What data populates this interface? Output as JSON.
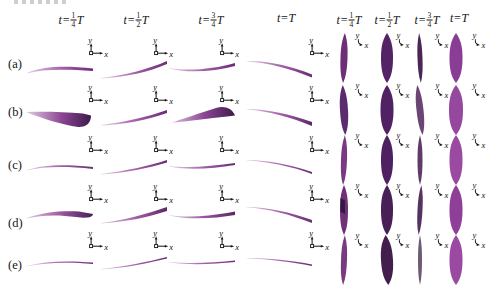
{
  "figure": {
    "background": "#ffffff",
    "description_rows": 5
  },
  "rows": [
    "(a)",
    "(b)",
    "(c)",
    "(d)",
    "(e)"
  ],
  "axis_labels": {
    "x": "x",
    "y": "y"
  },
  "headers_side": [
    {
      "lhs": "t=",
      "num": "1",
      "den": "4",
      "rhs": "T"
    },
    {
      "lhs": "t=",
      "num": "1",
      "den": "2",
      "rhs": "T"
    },
    {
      "lhs": "t=",
      "num": "3",
      "den": "4",
      "rhs": "T"
    },
    {
      "lhs": "t=",
      "rhs": "T"
    }
  ],
  "headers_front": [
    {
      "lhs": "t=",
      "num": "1",
      "den": "4",
      "rhs": "T"
    },
    {
      "lhs": "t=",
      "num": "1",
      "den": "2",
      "rhs": "T"
    },
    {
      "lhs": "t=",
      "num": "3",
      "den": "4",
      "rhs": "T"
    },
    {
      "lhs": "t=",
      "rhs": "T"
    }
  ],
  "colors": {
    "plate_light": "#e6d2e6",
    "plate_mid": "#a05ba5",
    "plate_dark": "#6b2d76",
    "wedge_dark": "#3f1a4d",
    "leaf_dark": "#4a2058",
    "leaf_bright": "#9a4aa1",
    "axis_ink": "#111111"
  },
  "layout": {
    "canvas": {
      "w": 503,
      "h": 301
    },
    "row_label_x": 8,
    "row_label_y": [
      57,
      105,
      158,
      216,
      258
    ],
    "header_y": 12,
    "side_header_cx": [
      71,
      136,
      211,
      286
    ],
    "front_header_cx": [
      349,
      387,
      427,
      459
    ],
    "side_col_x": [
      27,
      101,
      169,
      246
    ],
    "side_row_y": [
      56,
      104,
      154,
      202,
      250
    ],
    "side_icon_x": [
      85,
      150,
      216,
      306
    ],
    "side_icon_y": [
      36,
      83,
      133,
      182,
      229
    ],
    "front_col_cx": [
      344,
      387,
      420,
      456
    ],
    "front_row_y": [
      32,
      84,
      134,
      184,
      234
    ],
    "front_icon_x": [
      352,
      393,
      432,
      469
    ],
    "front_icon_y": [
      31,
      81,
      131,
      181,
      231
    ],
    "leaf_h": 52
  },
  "side_cells": [
    [
      {
        "path": "M0,17 C18,9.5 40,10 66,12.5 L66,15 C40,13.5 18,12.5 0,17.5 Z",
        "g": [
          "#e6d2e6",
          "#a05ba5",
          "#6b2d76"
        ]
      },
      {
        "path": "M0,22 C25,19 48,13 66,5 L66,8 C48,16 25,21 0,22.5 Z",
        "g": [
          "#e6d2e6",
          "#a05ba5",
          "#6b2d76"
        ]
      },
      {
        "path": "M0,12 C20,15.5 45,13 66,7 L66,10 C45,15.5 20,17.5 0,12.5 Z",
        "g": [
          "#e6d2e6",
          "#a05ba5",
          "#6b2d76"
        ]
      },
      {
        "path": "M1,5 C22,4.5 45,10 66,18.5 L66,21.5 C45,13 22,6.5 1,5.5 Z",
        "g": [
          "#e6d2e6",
          "#a05ba5",
          "#6b2d76"
        ]
      }
    ],
    [
      {
        "path": "M0,8 C18,7.5 38,8 56,9.5 L64,11.5 C64,19 59,23.5 51,23 C35,21 13,13.5 0,8.5 Z",
        "g": [
          "#e0c9e0",
          "#8a4492",
          "#3f1a4d"
        ]
      },
      {
        "path": "M0,21 C24,18 46,13 66,6 L66,9 C46,16 24,20.5 0,21.5 Z",
        "g": [
          "#e6d2e6",
          "#a05ba5",
          "#6b2d76"
        ]
      },
      {
        "path": "M0,19 C20,17 40,14.5 58,12.5 L66,11.5 C63,4 55,1.5 47,4 C31,9 12,15.5 0,19.5 Z",
        "g": [
          "#e0c9e0",
          "#8a4492",
          "#3f1a4d"
        ]
      },
      {
        "path": "M1,5 C22,5 44,10.5 66,18 L66,22 C44,13 22,7 1,5.5 Z",
        "g": [
          "#e6d2e6",
          "#a05ba5",
          "#5e2769"
        ]
      }
    ],
    [
      {
        "path": "M0,16 C16,10.5 38,10 66,13 L66,15 C38,12 16,12.5 0,16.5 Z",
        "g": [
          "#e6d2e6",
          "#a05ba5",
          "#6b2d76"
        ]
      },
      {
        "path": "M0,20 C24,17 48,12 66,6 L66,8.5 C48,14 24,19 0,20.5 Z",
        "g": [
          "#e6d2e6",
          "#a05ba5",
          "#6b2d76"
        ]
      },
      {
        "path": "M0,12 C20,14.5 44,12 66,9 L66,11 C44,14.5 20,16.5 0,12.5 Z",
        "g": [
          "#e6d2e6",
          "#a05ba5",
          "#6b2d76"
        ]
      },
      {
        "path": "M1,6 C22,6 46,11 66,18 L66,20 C46,12.5 22,7.5 1,6.5 Z",
        "g": [
          "#e6d2e6",
          "#a05ba5",
          "#6b2d76"
        ]
      }
    ],
    [
      {
        "path": "M0,16 C16,10 36,8.5 52,9.5 L66,12 C66,15.5 59,16.5 49,15 C31,12.5 14,13 0,16.5 Z",
        "g": [
          "#e0c9e0",
          "#96529b",
          "#44205a"
        ]
      },
      {
        "path": "M0,21 C24,18 46,12 66,5 L66,9 C46,15.5 24,20 0,21.5 Z",
        "g": [
          "#e6d2e6",
          "#a05ba5",
          "#5e2769"
        ]
      },
      {
        "path": "M0,13 C18,16 40,14 58,11 L66,9.5 L66,13 C46,16.5 20,18 0,13.5 Z",
        "g": [
          "#e6d2e6",
          "#96529b",
          "#5e2769"
        ]
      },
      {
        "path": "M1,5 C22,5 44,10.5 66,18 L66,21 C44,12.5 22,6.5 1,5.5 Z",
        "g": [
          "#e6d2e6",
          "#a05ba5",
          "#6b2d76"
        ]
      }
    ],
    [
      {
        "path": "M0,16 C18,11 40,10.5 66,12.5 L66,14 C40,12 18,12.5 0,16.5 Z",
        "g": [
          "#e6d2e6",
          "#a05ba5",
          "#6b2d76"
        ]
      },
      {
        "path": "M0,19 C24,16.5 46,12 66,7 L66,8.5 C46,13.5 24,18 0,19.5 Z",
        "g": [
          "#e6d2e6",
          "#a05ba5",
          "#6b2d76"
        ]
      },
      {
        "path": "M0,12 C22,14 46,12.5 66,10.5 L66,12 C46,14 22,15.5 0,12.5 Z",
        "g": [
          "#e6d2e6",
          "#a05ba5",
          "#6b2d76"
        ]
      },
      {
        "path": "M1,8 C22,8 46,10.5 66,14.5 L66,16 C46,12 22,9 1,8.5 Z",
        "g": [
          "#e6d2e6",
          "#a05ba5",
          "#6b2d76"
        ]
      }
    ]
  ],
  "front_cells": [
    [
      {
        "rx": 3.5,
        "fill": "#6d2f76",
        "skew": -2
      },
      {
        "rx": 6.0,
        "fill": "#532366",
        "skew": 0
      },
      {
        "rx": 2.5,
        "fill": "#4a2555",
        "skew": 2
      },
      {
        "rx": 6.5,
        "fill": "#8a3d94",
        "skew": 0
      }
    ],
    [
      {
        "rx": 4.0,
        "fill": "#5c2a6e",
        "skew": 3
      },
      {
        "rx": 6.5,
        "fill": "#512263",
        "skew": 0
      },
      {
        "rx": 3.5,
        "fill": "#6b4573",
        "skew": 6
      },
      {
        "rx": 7.0,
        "fill": "#96479e",
        "skew": 0
      }
    ],
    [
      {
        "rx": 3.0,
        "fill": "#7a3a82",
        "skew": -2
      },
      {
        "rx": 6.0,
        "fill": "#4e2160",
        "skew": 0
      },
      {
        "rx": 2.5,
        "fill": "#5f3b68",
        "skew": 0
      },
      {
        "rx": 6.5,
        "fill": "#9a4aa1",
        "skew": 0
      }
    ],
    [
      {
        "rx": 4.0,
        "fill": "#6f3077",
        "skew": 0,
        "inner": "#33183f"
      },
      {
        "rx": 6.0,
        "fill": "#482057",
        "skew": 0
      },
      {
        "rx": 2.5,
        "fill": "#55335e",
        "skew": -3
      },
      {
        "rx": 6.5,
        "fill": "#8f3f98",
        "skew": 0
      }
    ],
    [
      {
        "rx": 3.0,
        "fill": "#7a3a82",
        "skew": -2
      },
      {
        "rx": 6.0,
        "fill": "#431f4e",
        "skew": 3
      },
      {
        "rx": 2.0,
        "fill": "#6d5a74",
        "skew": 0
      },
      {
        "rx": 6.5,
        "fill": "#9a4aa1",
        "skew": 0
      }
    ]
  ]
}
